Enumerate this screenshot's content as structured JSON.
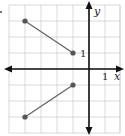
{
  "chart_data": {
    "type": "line",
    "title": "",
    "xlabel": "x",
    "ylabel": "y",
    "xlim": [
      -5,
      2
    ],
    "ylim": [
      -4,
      4
    ],
    "grid": true,
    "tick_labels": {
      "x": "1",
      "y": "1"
    },
    "series": [
      {
        "name": "segment-upper",
        "points": [
          [
            -4,
            3
          ],
          [
            -1,
            1
          ]
        ],
        "endpoints": [
          "closed",
          "closed"
        ]
      },
      {
        "name": "segment-lower",
        "points": [
          [
            -4,
            -3
          ],
          [
            -1,
            -1
          ]
        ],
        "endpoints": [
          "closed",
          "closed"
        ]
      }
    ],
    "colors": {
      "grid": "#cfcfcf",
      "axis": "#111111",
      "segment": "#666666",
      "point": "#555555"
    }
  },
  "labels": {
    "x_axis": "x",
    "y_axis": "y",
    "x_unit": "1",
    "y_unit": "1"
  }
}
